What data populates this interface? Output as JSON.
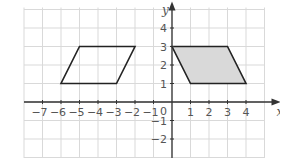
{
  "diagram": {
    "type": "coordinate-grid",
    "x_axis_label": "x",
    "y_axis_label": "y",
    "x_range": [
      -8,
      5
    ],
    "y_range": [
      -3,
      5
    ],
    "x_ticks": [
      -7,
      -6,
      -5,
      -4,
      -3,
      -2,
      -1,
      1,
      2,
      3,
      4
    ],
    "y_ticks": [
      -2,
      -1,
      1,
      2,
      3,
      4
    ],
    "origin_label": "0",
    "colors": {
      "grid": "#d9d9d9",
      "axis": "#333333",
      "shape_outline": "#222222",
      "shaded_fill": "#d9d9d9",
      "labels": "#555555"
    },
    "shapes": [
      {
        "name": "unshaded-parallelogram",
        "vertices": [
          [
            -6,
            1
          ],
          [
            -3,
            1
          ],
          [
            -2,
            3
          ],
          [
            -5,
            3
          ]
        ],
        "filled": false
      },
      {
        "name": "shaded-parallelogram",
        "vertices": [
          [
            0,
            3
          ],
          [
            3,
            3
          ],
          [
            4,
            1
          ],
          [
            1,
            1
          ]
        ],
        "filled": true
      }
    ]
  }
}
